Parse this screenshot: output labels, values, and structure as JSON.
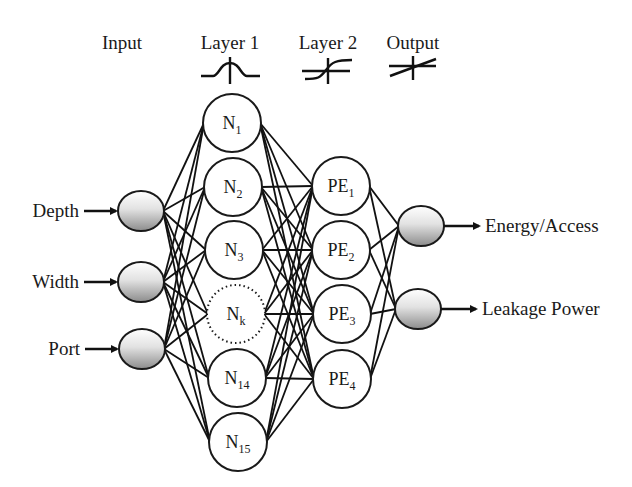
{
  "diagram": {
    "type": "neural-network-architecture",
    "headers": {
      "input": "Input",
      "layer1": "Layer 1",
      "layer2": "Layer 2",
      "output": "Output"
    },
    "activation_icons": {
      "layer1": "gaussian-icon",
      "layer2": "sigmoid-icon",
      "output": "linear-icon"
    },
    "inputs": [
      {
        "label": "Depth",
        "cx": 141,
        "cy": 211
      },
      {
        "label": "Width",
        "cx": 141,
        "cy": 282
      },
      {
        "label": "Port",
        "cx": 142,
        "cy": 349
      }
    ],
    "layer1": [
      {
        "base": "N",
        "sub": "1",
        "cx": 232,
        "cy": 123,
        "dotted": false
      },
      {
        "base": "N",
        "sub": "2",
        "cx": 233,
        "cy": 187,
        "dotted": false
      },
      {
        "base": "N",
        "sub": "3",
        "cx": 234,
        "cy": 250,
        "dotted": false
      },
      {
        "base": "N",
        "sub": "k",
        "cx": 236,
        "cy": 314,
        "dotted": true
      },
      {
        "base": "N",
        "sub": "14",
        "cx": 237,
        "cy": 378,
        "dotted": false
      },
      {
        "base": "N",
        "sub": "15",
        "cx": 238,
        "cy": 442,
        "dotted": false
      }
    ],
    "layer2": [
      {
        "base": "PE",
        "sub": "1",
        "cx": 341,
        "cy": 186
      },
      {
        "base": "PE",
        "sub": "2",
        "cx": 341,
        "cy": 250
      },
      {
        "base": "PE",
        "sub": "3",
        "cx": 342,
        "cy": 314
      },
      {
        "base": "PE",
        "sub": "4",
        "cx": 342,
        "cy": 379
      }
    ],
    "outputs": [
      {
        "label": "Energy/Access",
        "cx": 421,
        "cy": 226
      },
      {
        "label": "Leakage Power",
        "cx": 418,
        "cy": 309
      }
    ]
  }
}
